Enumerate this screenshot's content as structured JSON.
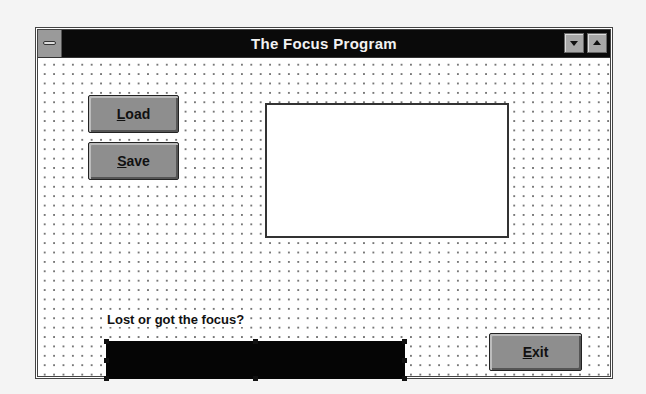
{
  "window": {
    "title": "The Focus Program",
    "system_menu": "control-menu-box",
    "minimize": "minimize-button",
    "maximize": "maximize-button"
  },
  "buttons": {
    "load": {
      "accel": "L",
      "rest": "oad"
    },
    "save": {
      "accel": "S",
      "rest": "ave"
    },
    "exit": {
      "accel": "E",
      "rest": "xit"
    }
  },
  "picture_box": {
    "content": ""
  },
  "focus_label": "Lost or got the focus?",
  "focus_textbox": {
    "value": "",
    "selected": true
  },
  "colors": {
    "titlebar": "#0a0a0a",
    "button_face": "#8e8e8e",
    "textbox_fill": "#050505",
    "grid_dot": "#777777"
  }
}
